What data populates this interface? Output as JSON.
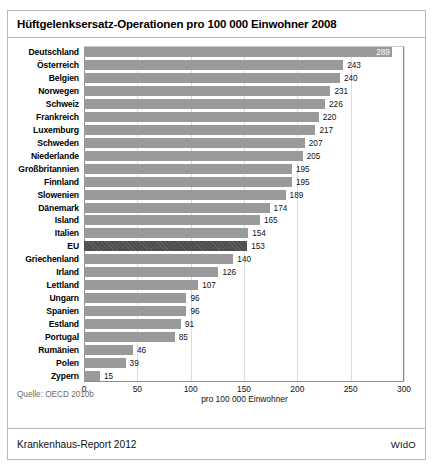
{
  "figure": {
    "title": "Hüftgelenksersatz-Operationen pro 100 000 Einwohner 2008",
    "source": "Quelle: OECD 2010b",
    "footer_left": "Krankenhaus-Report 2012",
    "footer_right": "WIdO",
    "colors": {
      "bar": "#9a9a9a",
      "bar_highlight": "#4d4d4d",
      "grid": "#dcdcdc",
      "axis": "#8d8d8d",
      "border": "#b9b9b9"
    }
  },
  "chart_data": {
    "type": "bar",
    "orientation": "horizontal",
    "title": "Hüftgelenksersatz-Operationen pro 100 000 Einwohner 2008",
    "xlabel": "pro 100 000 Einwohner",
    "ylabel": "",
    "xlim": [
      0,
      300
    ],
    "xticks": [
      0,
      50,
      100,
      150,
      200,
      250,
      300
    ],
    "grid": true,
    "legend": false,
    "highlight_category": "EU",
    "categories": [
      "Deutschland",
      "Österreich",
      "Belgien",
      "Norwegen",
      "Schweiz",
      "Frankreich",
      "Luxemburg",
      "Schweden",
      "Niederlande",
      "Großbritannien",
      "Finnland",
      "Slowenien",
      "Dänemark",
      "Island",
      "Italien",
      "EU",
      "Griechenland",
      "Irland",
      "Lettland",
      "Ungarn",
      "Spanien",
      "Estland",
      "Portugal",
      "Rumänien",
      "Polen",
      "Zypern"
    ],
    "values": [
      289,
      243,
      240,
      231,
      226,
      220,
      217,
      207,
      205,
      195,
      195,
      189,
      174,
      165,
      154,
      153,
      140,
      126,
      107,
      96,
      96,
      91,
      85,
      46,
      39,
      15
    ],
    "bars": [
      {
        "label": "Deutschland",
        "value": 289,
        "highlight": false,
        "value_inside": true
      },
      {
        "label": "Österreich",
        "value": 243,
        "highlight": false,
        "value_inside": false
      },
      {
        "label": "Belgien",
        "value": 240,
        "highlight": false,
        "value_inside": false
      },
      {
        "label": "Norwegen",
        "value": 231,
        "highlight": false,
        "value_inside": false
      },
      {
        "label": "Schweiz",
        "value": 226,
        "highlight": false,
        "value_inside": false
      },
      {
        "label": "Frankreich",
        "value": 220,
        "highlight": false,
        "value_inside": false
      },
      {
        "label": "Luxemburg",
        "value": 217,
        "highlight": false,
        "value_inside": false
      },
      {
        "label": "Schweden",
        "value": 207,
        "highlight": false,
        "value_inside": false
      },
      {
        "label": "Niederlande",
        "value": 205,
        "highlight": false,
        "value_inside": false
      },
      {
        "label": "Großbritannien",
        "value": 195,
        "highlight": false,
        "value_inside": false
      },
      {
        "label": "Finnland",
        "value": 195,
        "highlight": false,
        "value_inside": false
      },
      {
        "label": "Slowenien",
        "value": 189,
        "highlight": false,
        "value_inside": false
      },
      {
        "label": "Dänemark",
        "value": 174,
        "highlight": false,
        "value_inside": false
      },
      {
        "label": "Island",
        "value": 165,
        "highlight": false,
        "value_inside": false
      },
      {
        "label": "Italien",
        "value": 154,
        "highlight": false,
        "value_inside": false
      },
      {
        "label": "EU",
        "value": 153,
        "highlight": true,
        "value_inside": false
      },
      {
        "label": "Griechenland",
        "value": 140,
        "highlight": false,
        "value_inside": false
      },
      {
        "label": "Irland",
        "value": 126,
        "highlight": false,
        "value_inside": false
      },
      {
        "label": "Lettland",
        "value": 107,
        "highlight": false,
        "value_inside": false
      },
      {
        "label": "Ungarn",
        "value": 96,
        "highlight": false,
        "value_inside": false
      },
      {
        "label": "Spanien",
        "value": 96,
        "highlight": false,
        "value_inside": false
      },
      {
        "label": "Estland",
        "value": 91,
        "highlight": false,
        "value_inside": false
      },
      {
        "label": "Portugal",
        "value": 85,
        "highlight": false,
        "value_inside": false
      },
      {
        "label": "Rumänien",
        "value": 46,
        "highlight": false,
        "value_inside": false
      },
      {
        "label": "Polen",
        "value": 39,
        "highlight": false,
        "value_inside": false
      },
      {
        "label": "Zypern",
        "value": 15,
        "highlight": false,
        "value_inside": false
      }
    ]
  }
}
